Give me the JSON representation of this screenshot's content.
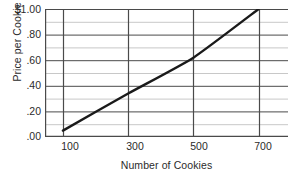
{
  "chart_data": {
    "type": "line",
    "title": "",
    "xlabel": "Number of Cookies",
    "ylabel": "Price per Cookie",
    "xlim": [
      45,
      790
    ],
    "ylim": [
      0,
      1.0
    ],
    "grid": true,
    "legend": false,
    "x_ticks": [
      100,
      300,
      500,
      700
    ],
    "x_tick_labels": [
      "100",
      "300",
      "500",
      "700"
    ],
    "y_ticks": [
      0.0,
      0.2,
      0.4,
      0.6,
      0.8,
      1.0
    ],
    "y_tick_labels": [
      ".00",
      ".20",
      ".40",
      ".60",
      ".80",
      "$1.00"
    ],
    "y_minor_ticks": [
      0.1,
      0.3,
      0.5,
      0.7,
      0.9
    ],
    "series": [
      {
        "name": "Price per Cookie",
        "color": "#1a1a1a",
        "x": [
          100,
          300,
          500,
          700
        ],
        "y": [
          0.05,
          0.34,
          0.62,
          1.0
        ]
      }
    ],
    "colors": {
      "line": "#1a1a1a",
      "major_gridline": "#4a4a4a",
      "minor_gridline": "#c8c8c8",
      "axis": "#4a4a4a",
      "background": "#ffffff",
      "text": "#2b2b2b"
    }
  },
  "axes": {
    "y_title": "Price per Cookie",
    "x_title": "Number of Cookies",
    "y_labels": [
      {
        "text": "$1.00",
        "top": 4
      },
      {
        "text": ".80",
        "top": 29
      },
      {
        "text": ".60",
        "top": 55
      },
      {
        "text": ".40",
        "top": 80
      },
      {
        "text": ".20",
        "top": 106
      },
      {
        "text": ".00",
        "top": 131
      }
    ],
    "x_labels": [
      {
        "text": "100",
        "left": 70
      },
      {
        "text": "300",
        "left": 135
      },
      {
        "text": "500",
        "left": 199
      },
      {
        "text": "700",
        "left": 263
      }
    ]
  }
}
